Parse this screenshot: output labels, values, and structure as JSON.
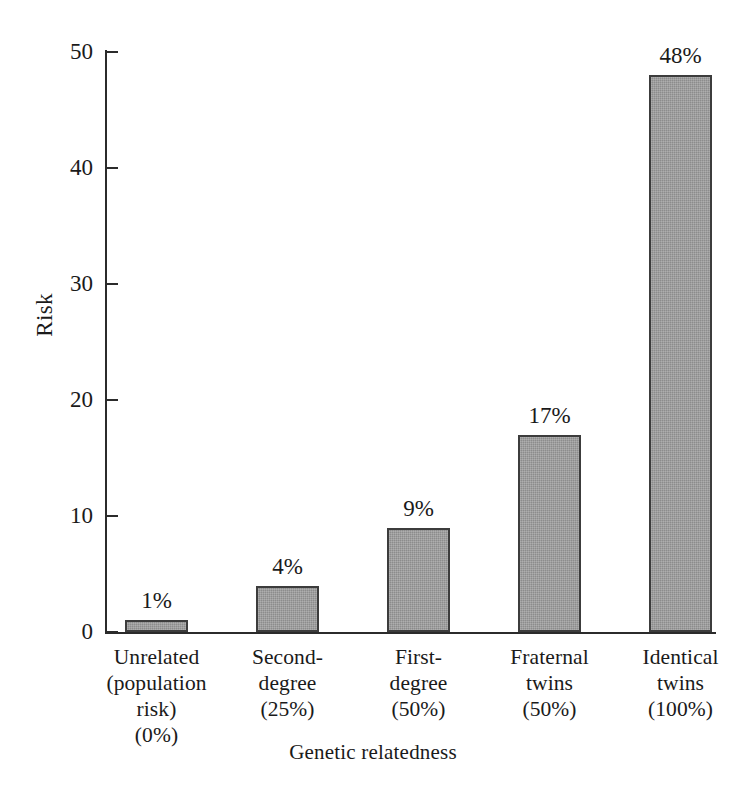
{
  "chart_data": {
    "type": "bar",
    "title": "",
    "xlabel": "Genetic relatedness",
    "ylabel": "Risk",
    "categories": [
      "Unrelated\n(population\nrisk)\n(0%)",
      "Second-\ndegree\n(25%)",
      "First-\ndegree\n(50%)",
      "Fraternal\ntwins\n(50%)",
      "Identical\ntwins\n(100%)"
    ],
    "values": [
      1,
      4,
      9,
      17,
      48
    ],
    "value_labels": [
      "1%",
      "4%",
      "9%",
      "17%",
      "48%"
    ],
    "ylim": [
      0,
      50
    ],
    "yticks": [
      0,
      10,
      20,
      30,
      40,
      50
    ],
    "ytick_labels": [
      "0",
      "10",
      "20",
      "30",
      "40",
      "50"
    ],
    "grid": false,
    "legend": null,
    "bar_color": "#8c8c8c",
    "bar_border_color": "#3c3c3c",
    "axis_color": "#2b2b2b",
    "background": "#ffffff"
  }
}
